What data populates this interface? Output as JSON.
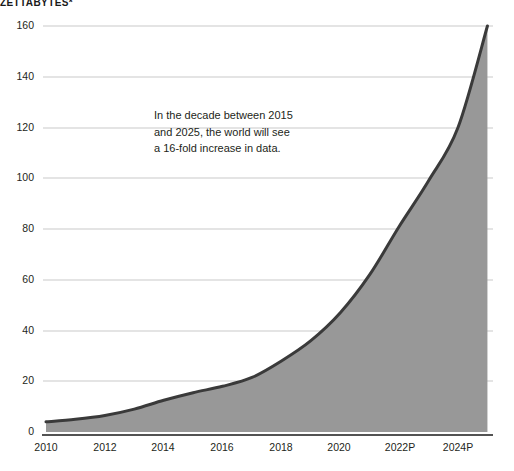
{
  "header": {
    "unit_title": "ZETTABYTES*"
  },
  "annotation": {
    "line1": "In the decade between 2015",
    "line2": "and 2025, the world will see",
    "line3": "a 16-fold increase in data."
  },
  "colors": {
    "area_fill": "#989898",
    "area_stroke": "#3a3a3a",
    "gridline": "#c9c9c9",
    "axis_line": "#1a1a1a",
    "text": "#231f20",
    "background": "#ffffff"
  },
  "axes": {
    "y_ticks": [
      "0",
      "20",
      "40",
      "60",
      "80",
      "100",
      "120",
      "140",
      "160"
    ],
    "x_ticks": [
      "2010",
      "2012",
      "2014",
      "2016",
      "2018",
      "2020",
      "2022P",
      "2024P"
    ]
  },
  "chart_data": {
    "type": "area",
    "title": "ZETTABYTES*",
    "xlabel": "",
    "ylabel": "ZETTABYTES*",
    "ylim": [
      0,
      170
    ],
    "xlim": [
      2010,
      2025
    ],
    "grid": true,
    "legend": false,
    "annotations": [
      {
        "text": "In the decade between 2015 and 2025, the world will see a 16-fold increase in data.",
        "x": 2015,
        "y": 126
      }
    ],
    "x": [
      2010,
      2011,
      2012,
      2013,
      2014,
      2015,
      2016,
      2017,
      2018,
      2019,
      2020,
      2021,
      2022,
      2023,
      2024,
      2025
    ],
    "categories": [
      "2010",
      "2011",
      "2012",
      "2013",
      "2014",
      "2015",
      "2016",
      "2017",
      "2018",
      "2019",
      "2020",
      "2021",
      "2022",
      "2023",
      "2024",
      "2025"
    ],
    "series": [
      {
        "name": "Global data volume",
        "units": "zettabytes",
        "values": [
          4,
          5,
          6.5,
          9,
          12.5,
          15.5,
          18,
          21.5,
          28,
          36,
          47,
          62,
          81,
          99,
          120,
          160
        ]
      }
    ],
    "values": [
      4,
      5,
      6.5,
      9,
      12.5,
      15.5,
      18,
      21.5,
      28,
      36,
      47,
      62,
      81,
      99,
      120,
      160
    ]
  },
  "geometry": {
    "plot_left": 43,
    "plot_right": 493,
    "plot_top": 26,
    "plot_bottom": 432,
    "y_tick_px": [
      432,
      381,
      331,
      280,
      229,
      178,
      128,
      77,
      26
    ],
    "x_tick_px": [
      46,
      105,
      163,
      222,
      281,
      339,
      400,
      458
    ]
  }
}
